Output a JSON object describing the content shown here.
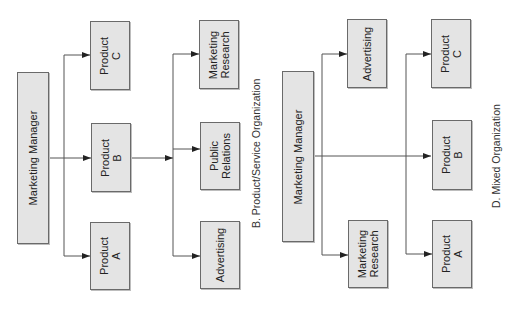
{
  "colors": {
    "box_fill": "#e4e4e4",
    "box_border": "#6a6a6a",
    "line": "#555555",
    "text": "#222222"
  },
  "diagram_b": {
    "caption": "B. Product/Service Organization",
    "manager": "Marketing Manager",
    "products": [
      {
        "label": "Product\nC"
      },
      {
        "label": "Product\nB"
      },
      {
        "label": "Product\nA"
      }
    ],
    "services": [
      {
        "label": "Marketing\nResearch"
      },
      {
        "label": "Public\nRelations"
      },
      {
        "label": "Advertising"
      }
    ]
  },
  "diagram_d": {
    "caption": "D. Mixed Organization",
    "manager": "Marketing Manager",
    "staff": [
      {
        "label": "Advertising"
      },
      {
        "label": "Marketing\nResearch"
      }
    ],
    "products": [
      {
        "label": "Product\nC"
      },
      {
        "label": "Product\nB"
      },
      {
        "label": "Product\nA"
      }
    ]
  }
}
